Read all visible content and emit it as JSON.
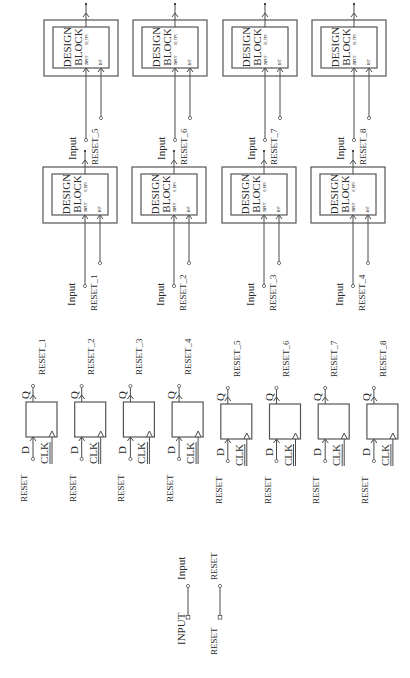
{
  "diagram": {
    "orientation": "rotated-90-ccw",
    "colors": {
      "line": "#4a4a4a",
      "text": "#2a2a2a",
      "background": "#ffffff"
    },
    "design_blocks": [
      {
        "title": [
          "DESIGN",
          "BLOCK"
        ],
        "ports": [
          "INPUT",
          "O_UPS",
          "RST"
        ],
        "input_label": "Input",
        "reset_label": "RESET_1"
      },
      {
        "title": [
          "DESIGN",
          "BLOCK"
        ],
        "ports": [
          "INPUT",
          "O_UPS",
          "RST"
        ],
        "input_label": "Input",
        "reset_label": "RESET_2"
      },
      {
        "title": [
          "DESIGN",
          "BLOCK"
        ],
        "ports": [
          "INPUT",
          "O_UPS",
          "RST"
        ],
        "input_label": "Input",
        "reset_label": "RESET_3"
      },
      {
        "title": [
          "DESIGN",
          "BLOCK"
        ],
        "ports": [
          "INPUT",
          "O_UPS",
          "RST"
        ],
        "input_label": "Input",
        "reset_label": "RESET_4"
      },
      {
        "title": [
          "DESIGN",
          "BLOCK"
        ],
        "ports": [
          "INPUT",
          "IO_TPS",
          "RST"
        ],
        "input_label": "Input",
        "reset_label": "RESET_5"
      },
      {
        "title": [
          "DESIGN",
          "BLOCK"
        ],
        "ports": [
          "INPUT",
          "IO_TPS",
          "RST"
        ],
        "input_label": "Input",
        "reset_label": "RESET_6"
      },
      {
        "title": [
          "DESIGN",
          "BLOCK"
        ],
        "ports": [
          "INPUT",
          "IO_TPS",
          "RST"
        ],
        "input_label": "Input",
        "reset_label": "RESET_7"
      },
      {
        "title": [
          "DESIGN",
          "BLOCK"
        ],
        "ports": [
          "INPUT",
          "IO_TPS",
          "RST"
        ],
        "input_label": "Input",
        "reset_label": "RESET_8"
      }
    ],
    "flip_flops": [
      {
        "d_label": "D",
        "clk_label": "CLK",
        "q_label": "Q",
        "d_net": "RESET",
        "q_net": "RESET_1"
      },
      {
        "d_label": "D",
        "clk_label": "CLK",
        "q_label": "Q",
        "d_net": "RESET",
        "q_net": "RESET_2"
      },
      {
        "d_label": "D",
        "clk_label": "CLK",
        "q_label": "Q",
        "d_net": "RESET",
        "q_net": "RESET_3"
      },
      {
        "d_label": "D",
        "clk_label": "CLK",
        "q_label": "Q",
        "d_net": "RESET",
        "q_net": "RESET_4"
      },
      {
        "d_label": "D",
        "clk_label": "CLK",
        "q_label": "Q",
        "d_net": "RESET",
        "q_net": "RESET_5"
      },
      {
        "d_label": "D",
        "clk_label": "CLK",
        "q_label": "Q",
        "d_net": "RESET",
        "q_net": "RESET_6"
      },
      {
        "d_label": "D",
        "clk_label": "CLK",
        "q_label": "Q",
        "d_net": "RESET",
        "q_net": "RESET_7"
      },
      {
        "d_label": "D",
        "clk_label": "CLK",
        "q_label": "Q",
        "d_net": "RESET",
        "q_net": "RESET_8"
      }
    ],
    "top_ports": [
      {
        "port_name": "INPUT",
        "net_label": "Input"
      },
      {
        "port_name": "RESET",
        "net_label": "RESET"
      }
    ]
  }
}
